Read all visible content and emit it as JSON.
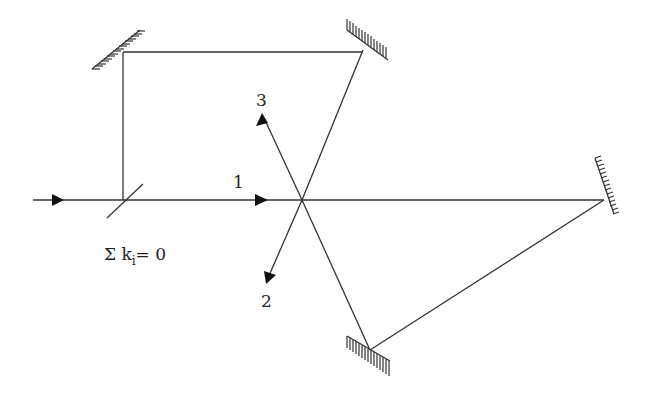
{
  "diagram": {
    "type": "optical-setup",
    "labels": {
      "beam1": "1",
      "beam2": "2",
      "beam3": "3",
      "sum_prefix": "Σ k",
      "sum_subscript": "i",
      "sum_suffix": "= 0"
    },
    "elements": [
      {
        "name": "beam-splitter",
        "at": [
          123,
          200
        ]
      },
      {
        "name": "mirror-top-left",
        "at": [
          123,
          52
        ]
      },
      {
        "name": "mirror-top-right",
        "at": [
          363,
          48
        ]
      },
      {
        "name": "mirror-right",
        "at": [
          604,
          200
        ]
      },
      {
        "name": "mirror-bottom",
        "at": [
          370,
          350
        ]
      },
      {
        "name": "crossing-point",
        "at": [
          302,
          200
        ]
      }
    ],
    "colors": {
      "line": "#333333",
      "background": "#ffffff"
    }
  }
}
